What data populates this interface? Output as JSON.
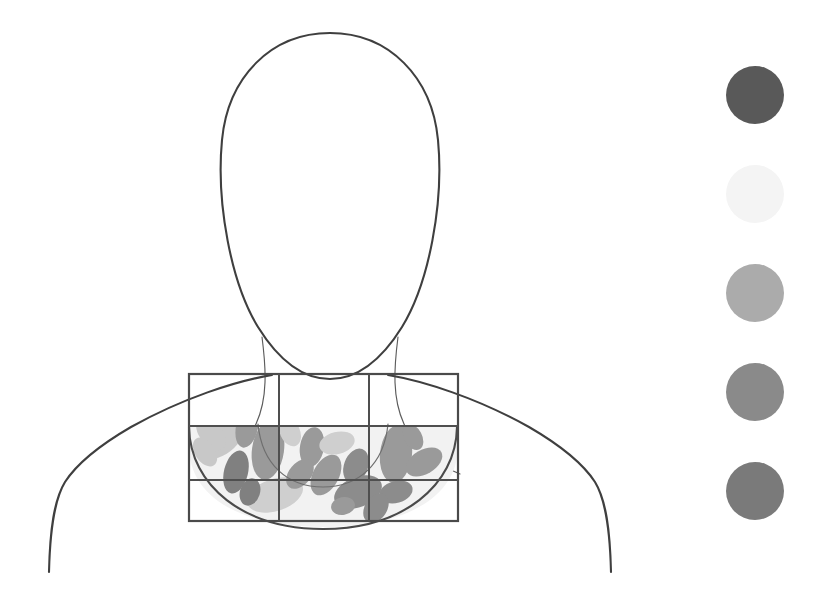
{
  "figure": {
    "title": "Anterior chest region mapping diagram",
    "background_color": "#ffffff",
    "outline_color": "#3f3f3f",
    "outline_thin_color": "#5c5c5c",
    "grid_color": "#4a4a4a"
  },
  "body_outline": {
    "head_label": "head-outline",
    "neck_label": "neck-outline",
    "shoulder_left_label": "left-shoulder-outline",
    "shoulder_right_label": "right-shoulder-outline",
    "head": {
      "center_x": 330,
      "center_y": 195,
      "radius_x": 108,
      "radius_y": 162
    },
    "neck_left_x": 272,
    "neck_right_x": 390,
    "chin_y": 372
  },
  "grid": {
    "label": "chest-region-grid",
    "x": 189,
    "y": 374,
    "width": 269,
    "height": 147,
    "columns": 3,
    "rows": 3,
    "column_dividers_x": [
      279,
      369
    ],
    "row_dividers_y": [
      426,
      480
    ],
    "cells": [
      {
        "id": "cell-r1c1",
        "row": 1,
        "column": 1
      },
      {
        "id": "cell-r1c2",
        "row": 1,
        "column": 2
      },
      {
        "id": "cell-r1c3",
        "row": 1,
        "column": 3
      },
      {
        "id": "cell-r2c1",
        "row": 2,
        "column": 1
      },
      {
        "id": "cell-r2c2",
        "row": 2,
        "column": 2
      },
      {
        "id": "cell-r2c3",
        "row": 2,
        "column": 3
      },
      {
        "id": "cell-r3c1",
        "row": 3,
        "column": 1
      },
      {
        "id": "cell-r3c2",
        "row": 3,
        "column": 2
      },
      {
        "id": "cell-r3c3",
        "row": 3,
        "column": 3
      }
    ]
  },
  "chest_region": {
    "label": "chest-arc-region",
    "fill_color": "#f2f2f2",
    "arc_stroke_color": "#4a4a4a",
    "inner_arc_stroke_color": "#6e6e6e"
  },
  "nodes": {
    "label": "node-cluster",
    "count": 22,
    "palette": {
      "light": "#c8c8c8",
      "light_alt": "#cfcfcf",
      "medium": "#9a9a9a",
      "medium_dark": "#8c8c8c",
      "dark": "#808080"
    },
    "items": [
      {
        "id": "node-01",
        "cx": 222,
        "cy": 440,
        "rx": 25,
        "ry": 14,
        "rotate": -38,
        "fill": "#c8c8c8"
      },
      {
        "id": "node-02",
        "cx": 247,
        "cy": 427,
        "rx": 11,
        "ry": 21,
        "rotate": 12,
        "fill": "#9a9a9a"
      },
      {
        "id": "node-03",
        "cx": 268,
        "cy": 450,
        "rx": 16,
        "ry": 30,
        "rotate": 8,
        "fill": "#9a9a9a"
      },
      {
        "id": "node-04",
        "cx": 236,
        "cy": 472,
        "rx": 12,
        "ry": 22,
        "rotate": 14,
        "fill": "#808080"
      },
      {
        "id": "node-05",
        "cx": 211,
        "cy": 434,
        "rx": 11,
        "ry": 19,
        "rotate": -40,
        "fill": "#c8c8c8"
      },
      {
        "id": "node-06",
        "cx": 275,
        "cy": 495,
        "rx": 29,
        "ry": 16,
        "rotate": -18,
        "fill": "#cfcfcf"
      },
      {
        "id": "node-07",
        "cx": 312,
        "cy": 447,
        "rx": 12,
        "ry": 20,
        "rotate": 10,
        "fill": "#9a9a9a"
      },
      {
        "id": "node-08",
        "cx": 337,
        "cy": 443,
        "rx": 18,
        "ry": 11,
        "rotate": -14,
        "fill": "#cfcfcf"
      },
      {
        "id": "node-09",
        "cx": 326,
        "cy": 475,
        "rx": 13,
        "ry": 22,
        "rotate": 28,
        "fill": "#9a9a9a"
      },
      {
        "id": "node-10",
        "cx": 356,
        "cy": 466,
        "rx": 12,
        "ry": 18,
        "rotate": 20,
        "fill": "#8c8c8c"
      },
      {
        "id": "node-11",
        "cx": 358,
        "cy": 492,
        "rx": 25,
        "ry": 15,
        "rotate": -22,
        "fill": "#8c8c8c"
      },
      {
        "id": "node-12",
        "cx": 396,
        "cy": 454,
        "rx": 16,
        "ry": 29,
        "rotate": 6,
        "fill": "#9a9a9a"
      },
      {
        "id": "node-13",
        "cx": 424,
        "cy": 462,
        "rx": 20,
        "ry": 12,
        "rotate": -30,
        "fill": "#9a9a9a"
      },
      {
        "id": "node-14",
        "cx": 396,
        "cy": 492,
        "rx": 17,
        "ry": 11,
        "rotate": -16,
        "fill": "#8c8c8c"
      },
      {
        "id": "node-15",
        "cx": 376,
        "cy": 508,
        "rx": 11,
        "ry": 16,
        "rotate": 34,
        "fill": "#8c8c8c"
      },
      {
        "id": "node-16",
        "cx": 290,
        "cy": 432,
        "rx": 10,
        "ry": 15,
        "rotate": -24,
        "fill": "#cfcfcf"
      },
      {
        "id": "node-17",
        "cx": 250,
        "cy": 492,
        "rx": 10,
        "ry": 14,
        "rotate": 18,
        "fill": "#808080"
      },
      {
        "id": "node-18",
        "cx": 300,
        "cy": 474,
        "rx": 11,
        "ry": 17,
        "rotate": 40,
        "fill": "#9a9a9a"
      },
      {
        "id": "node-19",
        "cx": 205,
        "cy": 452,
        "rx": 10,
        "ry": 16,
        "rotate": -34,
        "fill": "#c8c8c8"
      },
      {
        "id": "node-20",
        "cx": 343,
        "cy": 506,
        "rx": 12,
        "ry": 9,
        "rotate": -10,
        "fill": "#9a9a9a"
      },
      {
        "id": "node-21",
        "cx": 413,
        "cy": 437,
        "rx": 9,
        "ry": 14,
        "rotate": -28,
        "fill": "#9a9a9a"
      },
      {
        "id": "node-22",
        "cx": 228,
        "cy": 417,
        "rx": 13,
        "ry": 9,
        "rotate": -30,
        "fill": "#c8c8c8"
      }
    ]
  },
  "legend": {
    "label": "grayscale-legend",
    "center_x": 755,
    "radius": 29,
    "items": [
      {
        "id": "legend-dot-1",
        "index": 1,
        "color": "#595959",
        "cy": 95
      },
      {
        "id": "legend-dot-2",
        "index": 2,
        "color": "#f4f4f4",
        "cy": 194
      },
      {
        "id": "legend-dot-3",
        "index": 3,
        "color": "#ababab",
        "cy": 293
      },
      {
        "id": "legend-dot-4",
        "index": 4,
        "color": "#8a8a8a",
        "cy": 392
      },
      {
        "id": "legend-dot-5",
        "index": 5,
        "color": "#7a7a7a",
        "cy": 491
      }
    ]
  }
}
